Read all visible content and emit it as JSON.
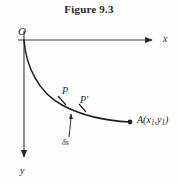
{
  "figure": {
    "title": "Figure 9.3",
    "caption_style": "bold-serif",
    "background_color": "#fefefe",
    "ink_color": "#262626"
  },
  "axes": {
    "origin_label": "O",
    "x_axis_label": "x",
    "y_axis_label": "y",
    "origin_px": [
      24,
      40
    ],
    "x_axis_end_px": [
      158,
      40
    ],
    "y_axis_end_px": [
      24,
      163
    ],
    "x_direction": "right",
    "y_direction": "down"
  },
  "curve": {
    "description": "brachistochrone-arc",
    "start_px": [
      24,
      40
    ],
    "end_px": [
      130,
      122
    ],
    "path": "M24,40 C26,66 38,92 62,105 C86,118 110,121 130,122"
  },
  "points": [
    {
      "name": "P",
      "label": "P",
      "label_px": [
        62,
        86
      ],
      "mark_px": [
        62,
        101
      ]
    },
    {
      "name": "Pp",
      "label": "P'",
      "label_px": [
        80,
        95
      ],
      "mark_px": [
        82,
        108
      ]
    },
    {
      "name": "A",
      "label_prefix": "A(x",
      "label_sub1": "1",
      "label_mid": ",y",
      "label_sub2": "1",
      "label_suffix": ")",
      "label_px": [
        137,
        116
      ],
      "mark_px": [
        130,
        122
      ],
      "dot": true
    }
  ],
  "annotations": [
    {
      "name": "arc-element",
      "label": "δs",
      "label_px": [
        63,
        139
      ],
      "arrow_from_px": [
        71,
        136
      ],
      "arrow_to_px": [
        71,
        112
      ],
      "meaning": "element of arc length between P and P-prime"
    }
  ]
}
